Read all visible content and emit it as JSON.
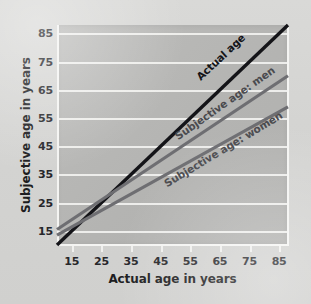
{
  "chart_data": {
    "type": "line",
    "title": "",
    "xlabel": "Actual age in years",
    "ylabel": "Subjective age in years",
    "xlim": [
      10,
      88
    ],
    "ylim": [
      10,
      88
    ],
    "xticks": [
      15,
      25,
      35,
      45,
      55,
      65,
      75,
      85
    ],
    "yticks": [
      15,
      25,
      35,
      45,
      55,
      65,
      75,
      85
    ],
    "xtick_labels": [
      "15",
      "25",
      "35",
      "45",
      "55",
      "65",
      "75",
      "85"
    ],
    "ytick_labels": [
      "15",
      "25",
      "35",
      "45",
      "55",
      "65",
      "75",
      "85"
    ],
    "grid": "horizontal",
    "legend_position": "inline-along-lines",
    "plot_background": "#b4b4b2",
    "gridline_color": "#f2f2f0",
    "series": [
      {
        "name": "Actual age",
        "color": "#141418",
        "width": 3.4,
        "x": [
          10,
          88
        ],
        "values": [
          10,
          88
        ]
      },
      {
        "name": "Subjective age: men",
        "color": "#6e6e72",
        "width": 3.2,
        "x": [
          10,
          88
        ],
        "values": [
          15.5,
          70
        ]
      },
      {
        "name": "Subjective age: women",
        "color": "#6e6e72",
        "width": 3.2,
        "x": [
          10,
          88
        ],
        "values": [
          13.5,
          59
        ]
      }
    ],
    "annotations": [
      {
        "text": "Actual age",
        "series": "Actual age"
      },
      {
        "text": "Subjective age: men",
        "series": "Subjective age: men"
      },
      {
        "text": "Subjective age: women",
        "series": "Subjective age: women"
      }
    ],
    "crossover_point": {
      "x": 30,
      "y": 25
    }
  }
}
